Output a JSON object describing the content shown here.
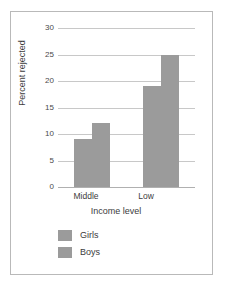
{
  "chart_data": {
    "type": "bar",
    "title": "",
    "subtitle": "",
    "categories": [
      "Middle",
      "Low"
    ],
    "series": [
      {
        "name": "Girls",
        "values": [
          9,
          19
        ],
        "color": "#9b9b9b"
      },
      {
        "name": "Boys",
        "values": [
          12,
          25
        ],
        "color": "#9b9b9b"
      }
    ],
    "xlabel": "Income level",
    "ylabel": "Percent rejected",
    "ylim": [
      0,
      30
    ],
    "yticks": [
      0,
      5,
      10,
      15,
      20,
      25,
      30
    ],
    "ytick_labels": [
      "0",
      "5",
      "10",
      "15",
      "20",
      "25",
      "30"
    ],
    "grid": true,
    "grid_axis": "y",
    "grid_color": "#c8c8c8",
    "legend": true,
    "legend_position": "below-axis-left",
    "legend_entries": [
      "Girls",
      "Boys"
    ],
    "frame_color": "#b9b9b9",
    "background": "#ffffff"
  }
}
